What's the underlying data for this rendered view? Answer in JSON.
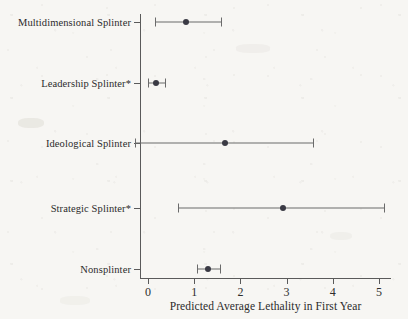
{
  "chart_data": {
    "type": "scatter",
    "subtype": "dot-and-whisker coefficient plot",
    "title": "",
    "xlabel": "Predicted Average Lethality in First Year",
    "ylabel": "",
    "xlim": [
      -0.45,
      5.35
    ],
    "xticks": [
      0,
      1,
      2,
      3,
      4,
      5
    ],
    "xtick_labels": [
      "0",
      "1",
      "2",
      "3",
      "4",
      "5"
    ],
    "grid": false,
    "legend": null,
    "categories": [
      "Multidimensional Splinter",
      "Leadership Splinter*",
      "Ideological Splinter",
      "Strategic Splinter*",
      "Nonsplinter"
    ],
    "values": [
      0.82,
      0.17,
      1.67,
      2.92,
      1.29
    ],
    "ci_low": [
      0.15,
      0.0,
      -0.28,
      0.66,
      1.06
    ],
    "ci_high": [
      1.58,
      0.36,
      3.58,
      5.1,
      1.55
    ],
    "points": [
      {
        "label": "Multidimensional Splinter",
        "estimate": 0.82,
        "ci_low": 0.15,
        "ci_high": 1.58
      },
      {
        "label": "Leadership Splinter*",
        "estimate": 0.17,
        "ci_low": 0.0,
        "ci_high": 0.36
      },
      {
        "label": "Ideological Splinter",
        "estimate": 1.67,
        "ci_low": -0.28,
        "ci_high": 3.58
      },
      {
        "label": "Strategic Splinter*",
        "estimate": 2.92,
        "ci_low": 0.66,
        "ci_high": 5.1
      },
      {
        "label": "Nonsplinter",
        "estimate": 1.29,
        "ci_low": 1.06,
        "ci_high": 1.55
      }
    ],
    "colors": {
      "point": "#3a3a44",
      "interval": "#6b6b6b",
      "axis": "#5a5a5a",
      "text": "#2b2b2b",
      "background": "#f7f6f3"
    }
  }
}
